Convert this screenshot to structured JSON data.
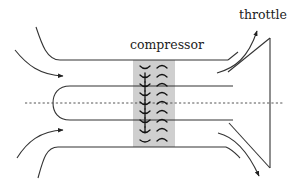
{
  "diagram": {
    "type": "schematic",
    "labels": {
      "compressor": "compressor",
      "throttle": "throttle"
    },
    "colors": {
      "line": "#333333",
      "compressor_fill": "#cfcfcf",
      "background": "#ffffff"
    },
    "components": [
      {
        "id": "inlet-flow-arrows",
        "count": 4
      },
      {
        "id": "outer-duct-walls",
        "count": 2
      },
      {
        "id": "hub-with-rounded-nose",
        "count": 1
      },
      {
        "id": "centerline",
        "style": "dashed"
      },
      {
        "id": "compressor-blade-row",
        "rotor_blades": 8,
        "stator_blades": 8
      },
      {
        "id": "throttle",
        "shape": "triangle"
      },
      {
        "id": "outlet-flow-arrows",
        "count": 2
      }
    ]
  }
}
